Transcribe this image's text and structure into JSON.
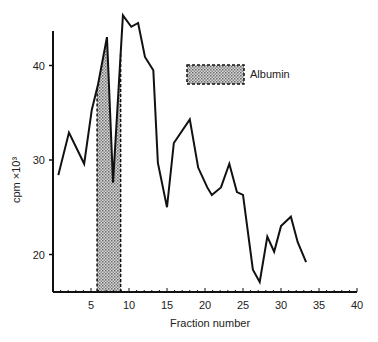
{
  "chart_data": {
    "type": "line",
    "title": "",
    "xlabel": "Fraction number",
    "ylabel": "cpm ×10³",
    "xlim": [
      0,
      40
    ],
    "ylim": [
      15.5,
      45.5
    ],
    "grid": false,
    "x_ticks": [
      5,
      10,
      15,
      20,
      25,
      30,
      35,
      40
    ],
    "y_ticks": [
      20,
      30,
      40
    ],
    "legend": {
      "position": "upper-right",
      "entries": [
        {
          "label": "Albumin",
          "style": "dotted-hatch box with dashed border"
        }
      ]
    },
    "series": [
      {
        "name": "cpm",
        "x": [
          0.7,
          2.1,
          4.1,
          5.1,
          5.9,
          7.1,
          7.9,
          9.2,
          10.3,
          11.2,
          12.1,
          13.2,
          13.8,
          15.0,
          15.9,
          18.0,
          19.1,
          20.3,
          20.9,
          22.1,
          23.2,
          24.2,
          25.0,
          26.3,
          27.2,
          28.2,
          29.1,
          30.0,
          31.3,
          32.2,
          33.3
        ],
        "y": [
          28.4,
          32.9,
          29.6,
          35.3,
          37.9,
          43.0,
          27.6,
          45.3,
          44.1,
          44.5,
          40.9,
          39.5,
          29.7,
          25.0,
          31.8,
          34.3,
          29.2,
          27.1,
          26.3,
          27.1,
          29.6,
          26.6,
          26.3,
          18.4,
          17.1,
          21.9,
          20.3,
          23.0,
          24.0,
          21.3,
          19.2
        ]
      }
    ],
    "shaded_regions": [
      {
        "label": "Albumin",
        "x_start": 5.8,
        "x_end": 8.9
      }
    ]
  },
  "labels": {
    "x_axis_title": "Fraction number",
    "y_axis_title": "cpm ×10³",
    "legend_albumin": "Albumin"
  }
}
